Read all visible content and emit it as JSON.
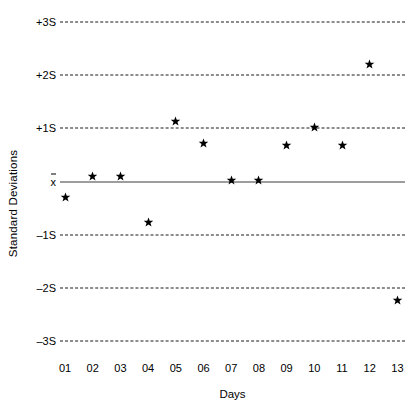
{
  "chart_data": {
    "type": "scatter",
    "title": "",
    "xlabel": "Days",
    "ylabel": "Standard Deviations",
    "categories": [
      "01",
      "02",
      "03",
      "04",
      "05",
      "06",
      "07",
      "08",
      "09",
      "10",
      "11",
      "12",
      "13"
    ],
    "values": [
      -0.31,
      0.1,
      0.1,
      -0.78,
      1.12,
      0.72,
      0.02,
      0.02,
      0.68,
      1.01,
      0.68,
      2.2,
      -2.23
    ],
    "series": [
      {
        "name": "QC result",
        "values": [
          -0.31,
          0.1,
          0.1,
          -0.78,
          1.12,
          0.72,
          0.02,
          0.02,
          0.68,
          1.01,
          0.68,
          2.2,
          -2.23
        ]
      }
    ],
    "ylim": [
      -3,
      3
    ],
    "y_tick_values": [
      3,
      2,
      1,
      0,
      -1,
      -2,
      -3
    ],
    "y_tick_labels": [
      "+3S",
      "+2S",
      "+1S",
      "x̄",
      "–1S",
      "–2S",
      "–3S"
    ],
    "grid": true,
    "grid_style": "dashed-horizontal",
    "mean_line_style": "solid",
    "legend": "none",
    "marker": "star",
    "marker_color": "#000000",
    "grid_color": "#1a1a1a",
    "mean_line_color": "#3d3d3d",
    "background": "#ffffff"
  },
  "axes": {
    "y_title": "Standard Deviations",
    "x_title": "Days"
  },
  "y_ticks": [
    {
      "label": "+3S",
      "value": 3
    },
    {
      "label": "+2S",
      "value": 2
    },
    {
      "label": "+1S",
      "value": 1
    },
    {
      "label": "x̄",
      "value": 0
    },
    {
      "label": "–1S",
      "value": -1
    },
    {
      "label": "–2S",
      "value": -2
    },
    {
      "label": "–3S",
      "value": -3
    }
  ],
  "x_ticks": [
    {
      "label": "01"
    },
    {
      "label": "02"
    },
    {
      "label": "03"
    },
    {
      "label": "04"
    },
    {
      "label": "05"
    },
    {
      "label": "06"
    },
    {
      "label": "07"
    },
    {
      "label": "08"
    },
    {
      "label": "09"
    },
    {
      "label": "10"
    },
    {
      "label": "11"
    },
    {
      "label": "12"
    },
    {
      "label": "13"
    }
  ],
  "points": [
    {
      "day": "01",
      "value": -0.31
    },
    {
      "day": "02",
      "value": 0.1
    },
    {
      "day": "03",
      "value": 0.1
    },
    {
      "day": "04",
      "value": -0.78
    },
    {
      "day": "05",
      "value": 1.12
    },
    {
      "day": "06",
      "value": 0.72
    },
    {
      "day": "07",
      "value": 0.02
    },
    {
      "day": "08",
      "value": 0.02
    },
    {
      "day": "09",
      "value": 0.68
    },
    {
      "day": "10",
      "value": 1.01
    },
    {
      "day": "11",
      "value": 0.68
    },
    {
      "day": "12",
      "value": 2.2
    },
    {
      "day": "13",
      "value": -2.23
    }
  ],
  "geometry": {
    "plot_left": 60,
    "plot_right": 405,
    "y_top_px": 22,
    "y_bottom_px": 341,
    "x_first_px": 65,
    "x_step_px": 27.7
  }
}
